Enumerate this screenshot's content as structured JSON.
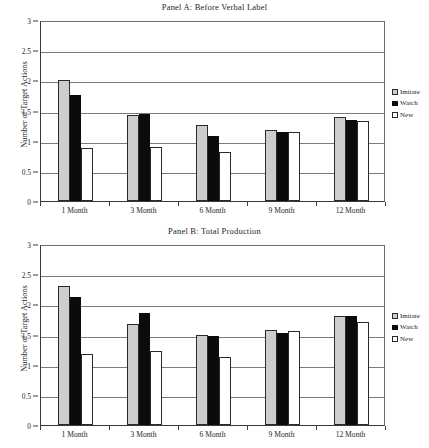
{
  "figure": {
    "ylabel": "Number of Target Actions",
    "categories": [
      "1 Month",
      "3 Month",
      "6 Month",
      "9 Month",
      "12 Month"
    ],
    "yticks": [
      "0",
      "0.5",
      "1",
      "1.5",
      "2",
      "2.5",
      "3"
    ],
    "legend": [
      {
        "label": "Imitate",
        "key": "imitate",
        "color": "#cdcdcd"
      },
      {
        "label": "Watch",
        "key": "watch",
        "color": "#0b0b0b"
      },
      {
        "label": "New",
        "key": "new",
        "color": "#ffffff"
      }
    ],
    "panels": [
      {
        "id": "a",
        "title": "Panel A: Before Verbal Label"
      },
      {
        "id": "b",
        "title": "Panel B: Total Production"
      }
    ]
  },
  "chart_data": [
    {
      "type": "bar",
      "title": "Panel A: Before Verbal Label",
      "xlabel": "",
      "ylabel": "Number of Target Actions",
      "ylim": [
        0,
        3
      ],
      "ytick_step": 0.5,
      "grid": true,
      "legend_position": "right",
      "categories": [
        "1 Month",
        "3 Month",
        "6 Month",
        "9 Month",
        "12 Month"
      ],
      "series": [
        {
          "name": "Imitate",
          "color": "#cdcdcd",
          "values": [
            2.0,
            1.42,
            1.26,
            1.17,
            1.39
          ]
        },
        {
          "name": "Watch",
          "color": "#0b0b0b",
          "values": [
            1.75,
            1.44,
            1.08,
            1.15,
            1.35
          ]
        },
        {
          "name": "New",
          "color": "#ffffff",
          "values": [
            0.88,
            0.9,
            0.81,
            1.15,
            1.32
          ]
        }
      ]
    },
    {
      "type": "bar",
      "title": "Panel B: Total Production",
      "xlabel": "",
      "ylabel": "Number of Target Actions",
      "ylim": [
        0,
        3
      ],
      "ytick_step": 0.5,
      "grid": true,
      "legend_position": "right",
      "categories": [
        "1 Month",
        "3 Month",
        "6 Month",
        "9 Month",
        "12 Month"
      ],
      "series": [
        {
          "name": "Imitate",
          "color": "#cdcdcd",
          "values": [
            2.3,
            1.67,
            1.49,
            1.57,
            1.81
          ]
        },
        {
          "name": "Watch",
          "color": "#0b0b0b",
          "values": [
            2.13,
            1.86,
            1.48,
            1.52,
            1.8
          ]
        },
        {
          "name": "New",
          "color": "#ffffff",
          "values": [
            1.18,
            1.23,
            1.12,
            1.56,
            1.71
          ]
        }
      ]
    }
  ]
}
